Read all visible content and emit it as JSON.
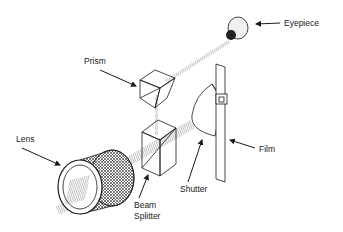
{
  "diagram": {
    "labels": {
      "eyepiece": "Eyepiece",
      "prism": "Prism",
      "lens": "Lens",
      "beam_splitter_line1": "Beam",
      "beam_splitter_line2": "Splitter",
      "shutter": "Shutter",
      "film": "Film"
    },
    "colors": {
      "ink": "#1a1a1a",
      "background": "#ffffff"
    }
  }
}
